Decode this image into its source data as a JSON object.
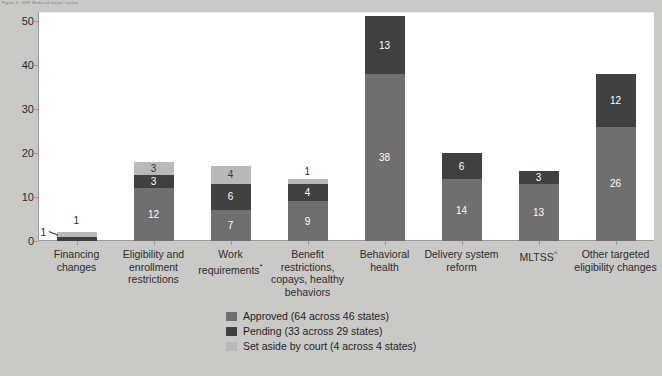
{
  "header": {
    "micro_text": "Figure 4 - KFF Medicaid waiver tracker"
  },
  "chart_data": {
    "type": "bar",
    "stacked": true,
    "title": "",
    "xlabel": "",
    "ylabel": "",
    "ylim": [
      0,
      52
    ],
    "yticks": [
      0,
      10,
      20,
      30,
      40,
      50
    ],
    "grid": false,
    "legend_position": "bottom-center",
    "categories": [
      "Financing changes",
      "Eligibility and enrollment restrictions",
      "Work requirements*",
      "Benefit restrictions, copays, healthy behaviors",
      "Behavioral health",
      "Delivery system reform",
      "MLTSS^",
      "Other targeted eligibility changes"
    ],
    "category_lines": [
      [
        "Financing",
        "changes"
      ],
      [
        "Eligibility and",
        "enrollment",
        "restrictions"
      ],
      [
        "Work",
        "requirements*"
      ],
      [
        "Benefit",
        "restrictions,",
        "copays, healthy",
        "behaviors"
      ],
      [
        "Behavioral",
        "health"
      ],
      [
        "Delivery system",
        "reform"
      ],
      [
        "MLTSS^"
      ],
      [
        "Other targeted",
        "eligibility changes"
      ]
    ],
    "series": [
      {
        "name": "Approved (64 across 46 states)",
        "key": "approved",
        "color": "#6f6f6f",
        "values": [
          0,
          12,
          7,
          9,
          38,
          14,
          13,
          26
        ]
      },
      {
        "name": "Pending (33 across 29 states)",
        "key": "pending",
        "color": "#404040",
        "values": [
          1,
          3,
          6,
          4,
          13,
          6,
          3,
          12
        ]
      },
      {
        "name": "Set aside by court (4 across 4 states)",
        "key": "setaside",
        "color": "#b9b9b9",
        "values": [
          1,
          3,
          4,
          1,
          0,
          0,
          0,
          0
        ]
      }
    ],
    "totals": [
      2,
      18,
      17,
      14,
      51,
      20,
      16,
      38
    ],
    "outside_labels": [
      {
        "category": "Financing changes",
        "series": "setaside",
        "text": "1"
      },
      {
        "category": "Financing changes",
        "series": "pending",
        "text": "1"
      },
      {
        "category": "Benefit restrictions, copays, healthy behaviors",
        "series": "setaside",
        "text": "1"
      }
    ]
  },
  "legend": {
    "items": [
      {
        "label": "Approved (64 across 46 states)",
        "key": "approved"
      },
      {
        "label": "Pending (33 across 29 states)",
        "key": "pending"
      },
      {
        "label": "Set aside by court (4 across 4 states)",
        "key": "setaside"
      }
    ]
  }
}
